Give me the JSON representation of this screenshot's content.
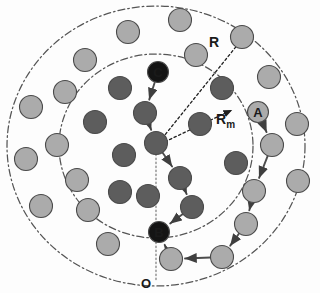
{
  "figure": {
    "background_color": "#fdfdfd",
    "node_dark_color": "#5d5d5d",
    "node_light_color": "#ababab",
    "node_stroke_color": "#4a4a4a",
    "label_node_color": "#1a1a1a",
    "link_color": "#4d4d4d",
    "circle_color": "#555555"
  },
  "annotations": {
    "outer_radius_label": "R",
    "inner_radius_label": "R",
    "inner_radius_subscript": "m",
    "origin_label": "O",
    "node_a_label": "A",
    "node_b_label": "B",
    "node_c_label": "C"
  },
  "chart_data": {
    "type": "scatter",
    "xlabel": "",
    "ylabel": "",
    "xlim": [
      0,
      320
    ],
    "ylim": [
      0,
      293
    ],
    "grid": false,
    "legend": null,
    "circles": [
      {
        "name": "outer-coverage-circle",
        "cx": 156,
        "cy": 146,
        "rx": 149,
        "ry": 140,
        "label": "R",
        "style": "dash-dot"
      },
      {
        "name": "inner-coverage-circle",
        "cx": 156,
        "cy": 146,
        "rx": 97,
        "ry": 92,
        "label": "R_m",
        "style": "dash-dot"
      }
    ],
    "radius_arrows": [
      {
        "name": "R",
        "from": [
          156,
          146
        ],
        "to": [
          243,
          38
        ],
        "label": "R",
        "label_pos": [
          214,
          47
        ]
      },
      {
        "name": "Rm",
        "from": [
          156,
          146
        ],
        "to": [
          232,
          110
        ],
        "label": "Rm",
        "label_pos": [
          216,
          124
        ]
      }
    ],
    "origin_line": {
      "from": [
        156,
        146
      ],
      "to": [
        156,
        280
      ],
      "style": "dotted"
    },
    "nodes": [
      {
        "id": "n1",
        "x": 128,
        "y": 32,
        "shade": "light",
        "label": ""
      },
      {
        "id": "n2",
        "x": 180,
        "y": 20,
        "shade": "light",
        "label": ""
      },
      {
        "id": "n3",
        "x": 242,
        "y": 37,
        "shade": "light",
        "label": ""
      },
      {
        "id": "n4",
        "x": 85,
        "y": 60,
        "shade": "light",
        "label": ""
      },
      {
        "id": "n5",
        "x": 196,
        "y": 55,
        "shade": "light",
        "label": ""
      },
      {
        "id": "n6",
        "x": 269,
        "y": 77,
        "shade": "light",
        "label": ""
      },
      {
        "id": "n7",
        "x": 65,
        "y": 92,
        "shade": "light",
        "label": ""
      },
      {
        "id": "n8",
        "x": 31,
        "y": 107,
        "shade": "light",
        "label": ""
      },
      {
        "id": "n9",
        "x": 297,
        "y": 124,
        "shade": "light",
        "label": ""
      },
      {
        "id": "n10",
        "x": 57,
        "y": 145,
        "shade": "light",
        "label": ""
      },
      {
        "id": "n11",
        "x": 26,
        "y": 159,
        "shade": "light",
        "label": ""
      },
      {
        "id": "n12",
        "x": 77,
        "y": 180,
        "shade": "light",
        "label": ""
      },
      {
        "id": "n13",
        "x": 298,
        "y": 181,
        "shade": "light",
        "label": ""
      },
      {
        "id": "n14",
        "x": 41,
        "y": 206,
        "shade": "light",
        "label": ""
      },
      {
        "id": "n15",
        "x": 88,
        "y": 210,
        "shade": "light",
        "label": ""
      },
      {
        "id": "n16",
        "x": 108,
        "y": 244,
        "shade": "light",
        "label": ""
      },
      {
        "id": "n17",
        "x": 120,
        "y": 88,
        "shade": "dark",
        "label": ""
      },
      {
        "id": "n18",
        "x": 95,
        "y": 122,
        "shade": "dark",
        "label": ""
      },
      {
        "id": "n19",
        "x": 124,
        "y": 155,
        "shade": "dark",
        "label": ""
      },
      {
        "id": "n20",
        "x": 120,
        "y": 192,
        "shade": "dark",
        "label": ""
      },
      {
        "id": "n21",
        "x": 148,
        "y": 196,
        "shade": "dark",
        "label": ""
      },
      {
        "id": "n22",
        "x": 222,
        "y": 88,
        "shade": "dark",
        "label": ""
      },
      {
        "id": "n23",
        "x": 236,
        "y": 163,
        "shade": "dark",
        "label": ""
      },
      {
        "id": "center",
        "x": 156,
        "y": 143,
        "shade": "dark",
        "label": ""
      },
      {
        "id": "c1",
        "x": 145,
        "y": 113,
        "shade": "dark",
        "label": ""
      },
      {
        "id": "rm1",
        "x": 200,
        "y": 124,
        "shade": "dark",
        "label": ""
      },
      {
        "id": "b1",
        "x": 180,
        "y": 178,
        "shade": "dark",
        "label": ""
      },
      {
        "id": "b2",
        "x": 192,
        "y": 207,
        "shade": "dark",
        "label": ""
      },
      {
        "id": "a1",
        "x": 272,
        "y": 145,
        "shade": "light",
        "label": ""
      },
      {
        "id": "a2",
        "x": 254,
        "y": 191,
        "shade": "light",
        "label": ""
      },
      {
        "id": "a3",
        "x": 246,
        "y": 224,
        "shade": "light",
        "label": ""
      },
      {
        "id": "a4",
        "x": 222,
        "y": 257,
        "shade": "light",
        "label": ""
      },
      {
        "id": "a5",
        "x": 171,
        "y": 259,
        "shade": "light",
        "label": ""
      },
      {
        "id": "nodeC",
        "x": 158,
        "y": 72,
        "shade": "labelled-dark",
        "label": "C"
      },
      {
        "id": "nodeB",
        "x": 159,
        "y": 232,
        "shade": "labelled-dark",
        "label": "B"
      },
      {
        "id": "nodeA",
        "x": 258,
        "y": 112,
        "shade": "labelled-light",
        "label": "A"
      }
    ],
    "links": [
      {
        "from": "nodeC",
        "to": "c1"
      },
      {
        "from": "c1",
        "to": "center"
      },
      {
        "from": "center",
        "to": "b1"
      },
      {
        "from": "b1",
        "to": "b2"
      },
      {
        "from": "b2",
        "to": "nodeB"
      },
      {
        "from": "nodeA",
        "to": "a1"
      },
      {
        "from": "a1",
        "to": "a2"
      },
      {
        "from": "a2",
        "to": "a3"
      },
      {
        "from": "a3",
        "to": "a4"
      },
      {
        "from": "a4",
        "to": "a5"
      },
      {
        "from": "a5",
        "to": "nodeB"
      }
    ]
  }
}
